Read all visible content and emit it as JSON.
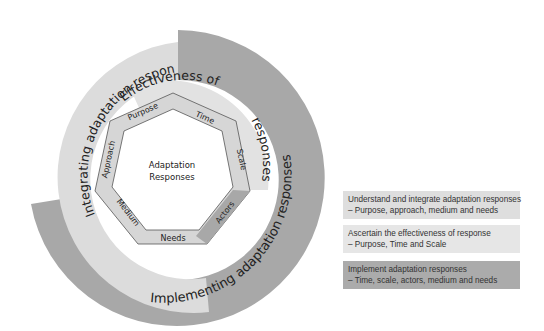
{
  "diagram": {
    "center_label": [
      "Adaptation",
      "Responses"
    ],
    "rings": {
      "integrating": "Integrating adaptation responses",
      "effectiveness_part1": "Effectiveness of",
      "effectiveness_part2": "responses",
      "implementing": "Implementing adaptation responses"
    },
    "heptagon_labels": {
      "purpose": "Purpose",
      "time": "Time",
      "scale": "Scale",
      "actors": "Actors",
      "needs": "Needs",
      "medium": "Medium",
      "approach": "Approach"
    },
    "colors": {
      "light_gray": "#dcdcdc",
      "mid_gray": "#c8c8c8",
      "dark_gray": "#a8a8a8",
      "outline": "#555555",
      "text": "#222222"
    }
  },
  "legend": [
    {
      "title": "Understand and integrate adaptation responses",
      "detail": "– Purpose, approach, medium and needs",
      "color": "#dedede"
    },
    {
      "title": "Ascertain the effectiveness of response",
      "detail": "– Purpose, Time and Scale",
      "color": "#e6e6e6"
    },
    {
      "title": "Implement adaptation responses",
      "detail": "– Time, scale, actors, medium and needs",
      "color": "#ababab"
    }
  ]
}
